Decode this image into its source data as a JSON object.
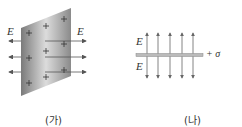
{
  "panel_a": {
    "caption": "(가)",
    "field_label_left": "E",
    "field_label_right": "E",
    "charge_symbol": "+",
    "plate_colors": {
      "dark": "#7a7a7a",
      "light": "#d8d8d8"
    },
    "arrow_color": "#555555"
  },
  "panel_b": {
    "caption": "(나)",
    "field_label_top": "E",
    "field_label_bottom": "E",
    "surface_charge_label": "+ σ",
    "arrow_count": 5,
    "arrow_color": "#666666",
    "plate_color": "#999999"
  }
}
